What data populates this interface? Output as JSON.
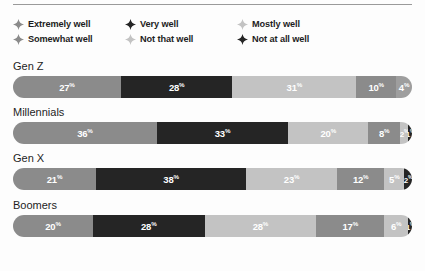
{
  "chart_data": {
    "type": "bar",
    "subtype": "stacked-horizontal-100",
    "title": "",
    "xlabel": "",
    "ylabel": "",
    "xlim": [
      0,
      100
    ],
    "grid": false,
    "legend_position": "top",
    "unit": "%",
    "categories": [
      "Gen Z",
      "Millennials",
      "Gen X",
      "Boomers"
    ],
    "series": [
      {
        "name": "Extremely well",
        "color": "#8b8b8b",
        "values": [
          27,
          36,
          21,
          20
        ]
      },
      {
        "name": "Very well",
        "color": "#252525",
        "values": [
          28,
          33,
          38,
          28
        ]
      },
      {
        "name": "Mostly well",
        "color": "#c3c3c3",
        "values": [
          31,
          20,
          23,
          28
        ]
      },
      {
        "name": "Somewhat well",
        "color": "#8b8b8b",
        "values": [
          10,
          8,
          12,
          17
        ]
      },
      {
        "name": "Not that well",
        "color": "#c3c3c3",
        "values": [
          4,
          2,
          5,
          6
        ]
      },
      {
        "name": "Not at all well",
        "color": "#252525",
        "values": [
          0,
          1,
          2,
          1
        ]
      }
    ]
  },
  "legend": {
    "items": [
      {
        "label": "Extremely well",
        "marker": "diamond-marker",
        "color": "#8b8b8b"
      },
      {
        "label": "Very well",
        "marker": "diamond-marker",
        "color": "#252525"
      },
      {
        "label": "Mostly well",
        "marker": "diamond-marker",
        "color": "#c3c3c3"
      },
      {
        "label": "Somewhat well",
        "marker": "diamond-marker",
        "color": "#8b8b8b"
      },
      {
        "label": "Not that well",
        "marker": "diamond-marker",
        "color": "#c3c3c3"
      },
      {
        "label": "Not at all well",
        "marker": "diamond-marker",
        "color": "#252525"
      }
    ]
  },
  "groups": [
    {
      "label": "Gen Z",
      "segments": [
        {
          "value": 27,
          "text": "27",
          "suffix": "%",
          "color": "#8b8b8b",
          "series": "Extremely well"
        },
        {
          "value": 28,
          "text": "28",
          "suffix": "%",
          "color": "#252525",
          "series": "Very well"
        },
        {
          "value": 31,
          "text": "31",
          "suffix": "%",
          "color": "#c3c3c3",
          "series": "Mostly well"
        },
        {
          "value": 10,
          "text": "10",
          "suffix": "%",
          "color": "#8b8b8b",
          "series": "Somewhat well"
        },
        {
          "value": 4,
          "text": "4",
          "suffix": "%",
          "color": "#9e9e9e",
          "series": "Not that well"
        }
      ]
    },
    {
      "label": "Millennials",
      "segments": [
        {
          "value": 36,
          "text": "36",
          "suffix": "%",
          "color": "#8b8b8b",
          "series": "Extremely well"
        },
        {
          "value": 33,
          "text": "33",
          "suffix": "%",
          "color": "#252525",
          "series": "Very well"
        },
        {
          "value": 20,
          "text": "20",
          "suffix": "%",
          "color": "#c3c3c3",
          "series": "Mostly well"
        },
        {
          "value": 8,
          "text": "8",
          "suffix": "%",
          "color": "#8b8b8b",
          "series": "Somewhat well"
        },
        {
          "value": 2,
          "text": "2",
          "suffix": "%",
          "color": "#c3c3c3",
          "series": "Not that well"
        },
        {
          "value": 1,
          "text": "1",
          "suffix": "%",
          "color": "#252525",
          "series": "Not at all well"
        }
      ]
    },
    {
      "label": "Gen X",
      "segments": [
        {
          "value": 21,
          "text": "21",
          "suffix": "%",
          "color": "#8b8b8b",
          "series": "Extremely well"
        },
        {
          "value": 38,
          "text": "38",
          "suffix": "%",
          "color": "#252525",
          "series": "Very well"
        },
        {
          "value": 23,
          "text": "23",
          "suffix": "%",
          "color": "#c3c3c3",
          "series": "Mostly well"
        },
        {
          "value": 12,
          "text": "12",
          "suffix": "%",
          "color": "#8b8b8b",
          "series": "Somewhat well"
        },
        {
          "value": 5,
          "text": "5",
          "suffix": "%",
          "color": "#c3c3c3",
          "series": "Not that well"
        },
        {
          "value": 2,
          "text": "2",
          "suffix": "%",
          "color": "#252525",
          "series": "Not at all well"
        }
      ]
    },
    {
      "label": "Boomers",
      "segments": [
        {
          "value": 20,
          "text": "20",
          "suffix": "%",
          "color": "#8b8b8b",
          "series": "Extremely well"
        },
        {
          "value": 28,
          "text": "28",
          "suffix": "%",
          "color": "#252525",
          "series": "Very well"
        },
        {
          "value": 28,
          "text": "28",
          "suffix": "%",
          "color": "#c3c3c3",
          "series": "Mostly well"
        },
        {
          "value": 17,
          "text": "17",
          "suffix": "%",
          "color": "#8b8b8b",
          "series": "Somewhat well"
        },
        {
          "value": 6,
          "text": "6",
          "suffix": "%",
          "color": "#c3c3c3",
          "series": "Not that well"
        },
        {
          "value": 1,
          "text": "1",
          "suffix": "%",
          "color": "#252525",
          "series": "Not at all well"
        }
      ]
    }
  ]
}
